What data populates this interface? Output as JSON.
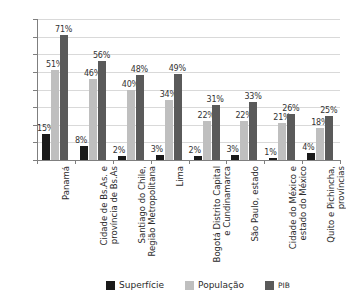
{
  "chart_data": {
    "type": "bar",
    "title": "",
    "subtitle": "",
    "xlabel": "",
    "ylabel": "",
    "ylim": [
      0,
      80
    ],
    "ytick_labels": [
      "80%",
      "70%",
      "60%",
      "50%",
      "40%",
      "30%",
      "20%",
      "10%",
      "0%"
    ],
    "ytick_values": [
      80,
      70,
      60,
      50,
      40,
      30,
      20,
      10,
      0
    ],
    "grid": true,
    "grid_axis": "y",
    "legend_position": "bottom",
    "value_suffix": "%",
    "categories": [
      "Panamá",
      "Cidade de Bs.As. e\nprovíncia de Bs.As",
      "Santiago do Chile,\nRegião Metropolitana",
      "Lima",
      "Bogotá Distrito Capital\ne Cundinamarca",
      "São Paulo, estado",
      "Cidade do México e\nestado do México",
      "Quito e Pichincha,\nprovíncias"
    ],
    "series": [
      {
        "name": "Superfície",
        "color": "#1a1a1a",
        "values": [
          15,
          8,
          2,
          3,
          2,
          3,
          1,
          4
        ],
        "labels": [
          "15%",
          "8%",
          "2%",
          "3%",
          "2%",
          "3%",
          "1%",
          "4%"
        ]
      },
      {
        "name": "População",
        "color": "#bfbfbf",
        "values": [
          51,
          46,
          40,
          34,
          22,
          22,
          21,
          18
        ],
        "labels": [
          "51%",
          "46%",
          "40%",
          "34%",
          "22%",
          "22%",
          "21%",
          "18%"
        ]
      },
      {
        "name": "PIB",
        "color": "#5a5a5a",
        "values": [
          71,
          56,
          48,
          49,
          31,
          33,
          26,
          25
        ],
        "labels": [
          "71%",
          "56%",
          "48%",
          "49%",
          "31%",
          "33%",
          "26%",
          "25%"
        ]
      }
    ]
  },
  "colors": {
    "background": "#ffffff",
    "axis": "#7f7f7f",
    "gridline": "#d9d9d9",
    "tick_text": "#3a3a3a",
    "label_text": "#2b2b2b"
  }
}
